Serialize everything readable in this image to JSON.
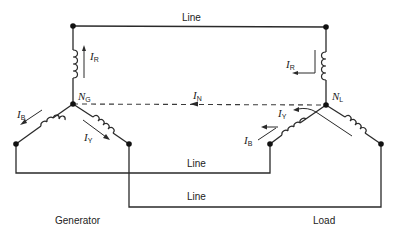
{
  "diagram": {
    "type": "three-phase star-connected generator and load with neutral",
    "labels": {
      "line_top": "Line",
      "line_middle": "Line",
      "line_bottom": "Line",
      "generator": "Generator",
      "load": "Load"
    },
    "nodes": {
      "generator_neutral": {
        "symbol": "N",
        "subscript": "G"
      },
      "load_neutral": {
        "symbol": "N",
        "subscript": "L"
      }
    },
    "currents": {
      "gen_red": {
        "symbol": "I",
        "subscript": "R"
      },
      "gen_blue": {
        "symbol": "I",
        "subscript": "B"
      },
      "gen_yellow": {
        "symbol": "I",
        "subscript": "Y"
      },
      "neutral": {
        "symbol": "I",
        "subscript": "N"
      },
      "load_red": {
        "symbol": "I",
        "subscript": "R"
      },
      "load_yellow": {
        "symbol": "I",
        "subscript": "Y"
      },
      "load_blue": {
        "symbol": "I",
        "subscript": "B"
      }
    },
    "colors": {
      "wire": "#2a2a2a",
      "background": "#ffffff"
    }
  }
}
